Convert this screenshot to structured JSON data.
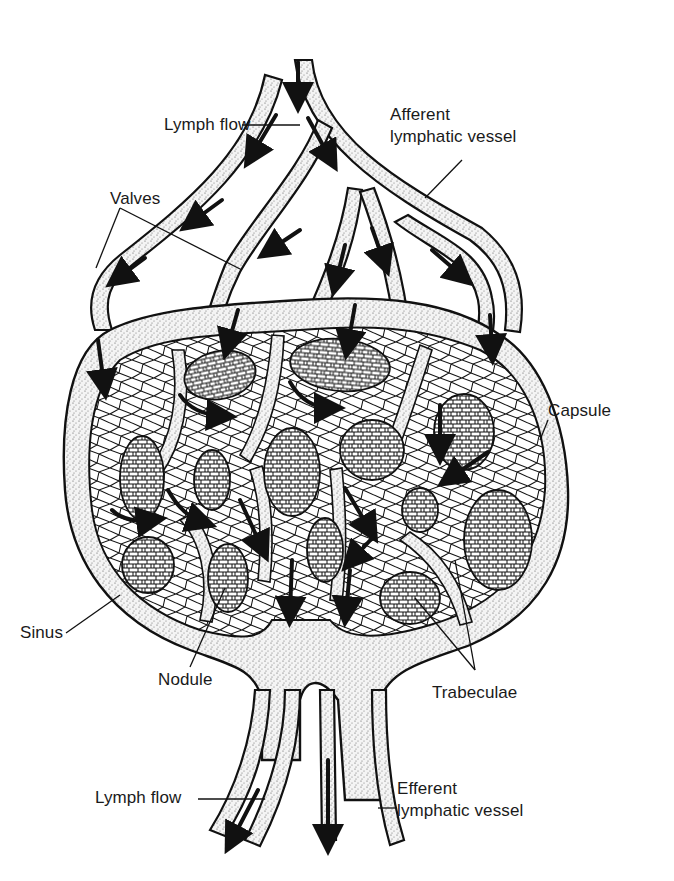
{
  "diagram": {
    "labels": {
      "lymph_flow_top": "Lymph flow",
      "afferent_line1": "Afferent",
      "afferent_line2": "lymphatic vessel",
      "valves": "Valves",
      "capsule": "Capsule",
      "sinus": "Sinus",
      "nodule": "Nodule",
      "trabeculae": "Trabeculae",
      "lymph_flow_bottom": "Lymph flow",
      "efferent_line1": "Efferent",
      "efferent_line2": "lymphatic vessel"
    },
    "colors": {
      "ink": "#111111",
      "background": "#ffffff",
      "stipple": "#555555"
    }
  }
}
